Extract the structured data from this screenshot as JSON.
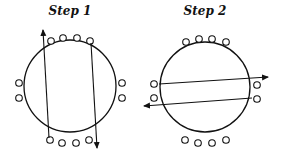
{
  "panels": [
    {
      "title": "Step 1",
      "title_x": 70,
      "circle": {
        "cx": 70,
        "cy": 86,
        "r": 46
      },
      "dots": [
        {
          "x": 51,
          "y": 41
        },
        {
          "x": 63,
          "y": 38
        },
        {
          "x": 77,
          "y": 38
        },
        {
          "x": 90,
          "y": 41
        },
        {
          "x": 50,
          "y": 140
        },
        {
          "x": 62,
          "y": 143
        },
        {
          "x": 76,
          "y": 143
        },
        {
          "x": 89,
          "y": 140
        },
        {
          "x": 19,
          "y": 83
        },
        {
          "x": 19,
          "y": 98
        },
        {
          "x": 122,
          "y": 83
        },
        {
          "x": 122,
          "y": 98
        }
      ],
      "arrows": [
        {
          "x1": 49,
          "y1": 138,
          "x2": 43,
          "y2": 30
        },
        {
          "x1": 91,
          "y1": 43,
          "x2": 97,
          "y2": 148
        }
      ]
    },
    {
      "title": "Step 2",
      "title_x": 205,
      "circle": {
        "cx": 205,
        "cy": 87,
        "r": 45
      },
      "dots": [
        {
          "x": 186,
          "y": 42
        },
        {
          "x": 199,
          "y": 39
        },
        {
          "x": 212,
          "y": 39
        },
        {
          "x": 226,
          "y": 42
        },
        {
          "x": 185,
          "y": 140
        },
        {
          "x": 198,
          "y": 143
        },
        {
          "x": 212,
          "y": 143
        },
        {
          "x": 226,
          "y": 140
        },
        {
          "x": 154,
          "y": 84
        },
        {
          "x": 154,
          "y": 98
        },
        {
          "x": 257,
          "y": 85
        },
        {
          "x": 257,
          "y": 99
        }
      ],
      "arrows": [
        {
          "x1": 159,
          "y1": 84,
          "x2": 268,
          "y2": 77
        },
        {
          "x1": 252,
          "y1": 98,
          "x2": 144,
          "y2": 106
        }
      ]
    }
  ],
  "colors": {
    "stroke": "#111111",
    "background": "#ffffff"
  }
}
